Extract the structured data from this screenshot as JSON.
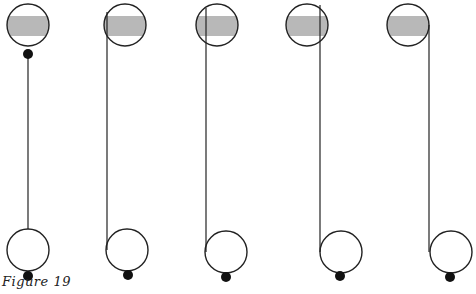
{
  "caption": "Figure 19",
  "colors": {
    "stroke": "#222222",
    "band": "#b8b8b8",
    "ball": "#111111"
  },
  "figures": [
    {
      "id": 1,
      "top": {
        "cx": 28,
        "cy": 25,
        "r": 21
      },
      "bottom": {
        "cx": 28,
        "cy": 250,
        "r": 21
      },
      "ball_top": {
        "cx": 28,
        "cy": 54,
        "r": 5
      },
      "ball_bottom": {
        "cx": 28,
        "cy": 276,
        "r": 5
      },
      "line": {
        "x1": 28,
        "y1": 58,
        "x2": 28,
        "y2": 229
      }
    },
    {
      "id": 2,
      "top": {
        "cx": 125,
        "cy": 25,
        "r": 21
      },
      "bottom": {
        "cx": 127,
        "cy": 250,
        "r": 21
      },
      "ball_top": null,
      "ball_bottom": {
        "cx": 128,
        "cy": 275,
        "r": 5
      },
      "line": {
        "x1": 107,
        "y1": 12,
        "x2": 107,
        "y2": 250
      }
    },
    {
      "id": 3,
      "top": {
        "cx": 217,
        "cy": 25,
        "r": 21
      },
      "bottom": {
        "cx": 226,
        "cy": 252,
        "r": 21
      },
      "ball_top": null,
      "ball_bottom": {
        "cx": 226,
        "cy": 277,
        "r": 5
      },
      "line": {
        "x1": 206,
        "y1": 8,
        "x2": 206,
        "y2": 252
      }
    },
    {
      "id": 4,
      "top": {
        "cx": 307,
        "cy": 25,
        "r": 21
      },
      "bottom": {
        "cx": 341,
        "cy": 252,
        "r": 21
      },
      "ball_top": null,
      "ball_bottom": {
        "cx": 340,
        "cy": 276,
        "r": 5
      },
      "line": {
        "x1": 320,
        "y1": 5,
        "x2": 320,
        "y2": 252
      }
    },
    {
      "id": 5,
      "top": {
        "cx": 408,
        "cy": 25,
        "r": 21
      },
      "bottom": {
        "cx": 451,
        "cy": 252,
        "r": 21
      },
      "ball_top": null,
      "ball_bottom": {
        "cx": 450,
        "cy": 277,
        "r": 5
      },
      "line": {
        "x1": 429,
        "y1": 25,
        "x2": 429,
        "y2": 252
      }
    }
  ],
  "band": {
    "y": 16,
    "height": 20
  }
}
